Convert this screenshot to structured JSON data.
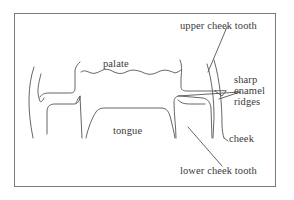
{
  "diagram": {
    "colors": {
      "line": "#555555",
      "frame": "#7a7a7a",
      "text": "#3a3a3a",
      "background": "#ffffff"
    },
    "labels": {
      "palate": "palate",
      "tongue": "tongue",
      "upper_cheek_tooth": "upper cheek tooth",
      "sharp_enamel_ridges": [
        "sharp",
        "enamel",
        "ridges"
      ],
      "cheek": "cheek",
      "lower_cheek_tooth": "lower cheek tooth"
    }
  }
}
